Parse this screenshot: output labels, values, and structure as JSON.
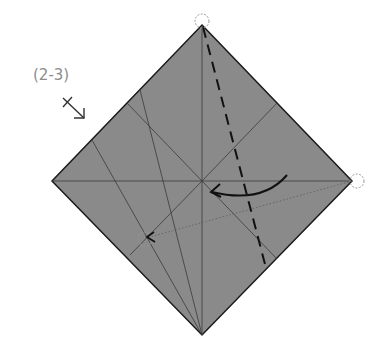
{
  "step": {
    "label": "(2-3)",
    "turn_over_symbol": "arrow-down-right-icon"
  },
  "paper": {
    "shape": "square-rotated-45",
    "fill": "#8a8a8a",
    "edge_color": "#1a1a1a",
    "vertices": {
      "top": [
        202,
        25
      ],
      "right": [
        352,
        181
      ],
      "bottom": [
        202,
        335
      ],
      "left": [
        52,
        181
      ]
    }
  },
  "creases": {
    "existing": [
      {
        "from": [
          52,
          181
        ],
        "to": [
          352,
          181
        ]
      },
      {
        "from": [
          202,
          25
        ],
        "to": [
          202,
          335
        ]
      },
      {
        "from": [
          127,
          103
        ],
        "to": [
          277,
          259
        ]
      },
      {
        "from": [
          140,
          90
        ],
        "to": [
          202,
          335
        ]
      },
      {
        "from": [
          92,
          140
        ],
        "to": [
          202,
          335
        ]
      },
      {
        "from": [
          277,
          103
        ],
        "to": [
          202,
          181
        ]
      }
    ],
    "valley_fold": {
      "from": [
        202,
        25
      ],
      "to": [
        266,
        268
      ],
      "style": "dashed"
    },
    "reference_dotted": {
      "from": [
        352,
        181
      ],
      "to": [
        145,
        238
      ]
    }
  },
  "markers": {
    "target_circles": [
      [
        202,
        25
      ],
      [
        352,
        181
      ],
      [
        145,
        238
      ]
    ],
    "fold_arrow": {
      "from": [
        287,
        175
      ],
      "to": [
        212,
        190
      ],
      "direction": "left"
    }
  }
}
